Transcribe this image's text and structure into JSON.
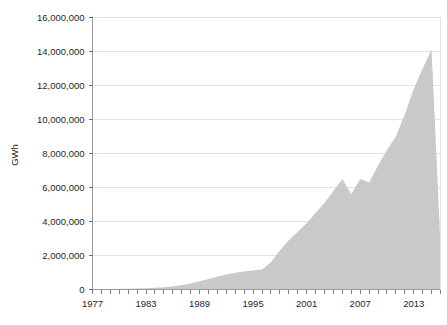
{
  "chart_data": {
    "type": "area",
    "title": "",
    "subtitle": "",
    "xlabel": "",
    "ylabel": "GWh",
    "xlim": [
      1977,
      2016
    ],
    "ylim": [
      0,
      16000000
    ],
    "grid": true,
    "legend": null,
    "series_color": "#c9c9c9",
    "y_ticks": [
      {
        "value": 0,
        "label": "0"
      },
      {
        "value": 2000000,
        "label": "2,000,000"
      },
      {
        "value": 4000000,
        "label": "4,000,000"
      },
      {
        "value": 6000000,
        "label": "6,000,000"
      },
      {
        "value": 8000000,
        "label": "8,000,000"
      },
      {
        "value": 10000000,
        "label": "10,000,000"
      },
      {
        "value": 12000000,
        "label": "12,000,000"
      },
      {
        "value": 14000000,
        "label": "14,000,000"
      },
      {
        "value": 16000000,
        "label": "16,000,000"
      }
    ],
    "x_ticks_labeled": [
      {
        "value": 1977,
        "label": "1977"
      },
      {
        "value": 1983,
        "label": "1983"
      },
      {
        "value": 1989,
        "label": "1989"
      },
      {
        "value": 1995,
        "label": "1995"
      },
      {
        "value": 2001,
        "label": "2001"
      },
      {
        "value": 2007,
        "label": "2007"
      },
      {
        "value": 2013,
        "label": "2013"
      }
    ],
    "x_minor_step": 1,
    "x": [
      1977,
      1978,
      1979,
      1980,
      1981,
      1982,
      1983,
      1984,
      1985,
      1986,
      1987,
      1988,
      1989,
      1990,
      1991,
      1992,
      1993,
      1994,
      1995,
      1996,
      1997,
      1998,
      1999,
      2000,
      2001,
      2002,
      2003,
      2004,
      2005,
      2006,
      2007,
      2008,
      2009,
      2010,
      2011,
      2012,
      2013,
      2014,
      2015,
      2016
    ],
    "values": [
      20000,
      25000,
      30000,
      40000,
      50000,
      60000,
      80000,
      100000,
      130000,
      180000,
      260000,
      360000,
      480000,
      620000,
      760000,
      880000,
      980000,
      1060000,
      1120000,
      1180000,
      1600000,
      2300000,
      2900000,
      3400000,
      3900000,
      4500000,
      5100000,
      5800000,
      6500000,
      5600000,
      6500000,
      6300000,
      7300000,
      8200000,
      9000000,
      10300000,
      11800000,
      13000000,
      14100000,
      2600000
    ],
    "series": [
      {
        "name": "GWh",
        "values": [
          20000,
          25000,
          30000,
          40000,
          50000,
          60000,
          80000,
          100000,
          130000,
          180000,
          260000,
          360000,
          480000,
          620000,
          760000,
          880000,
          980000,
          1060000,
          1120000,
          1180000,
          1600000,
          2300000,
          2900000,
          3400000,
          3900000,
          4500000,
          5100000,
          5800000,
          6500000,
          5600000,
          6500000,
          6300000,
          7300000,
          8200000,
          9000000,
          10300000,
          11800000,
          13000000,
          14100000,
          2600000
        ]
      }
    ],
    "annotations": []
  }
}
